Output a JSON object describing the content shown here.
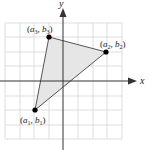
{
  "diagram": {
    "type": "coordinate-plane-triangle",
    "axes": {
      "x_label": "x",
      "y_label": "y"
    },
    "grid": {
      "x_range": [
        -4,
        4
      ],
      "y_range": [
        -4,
        4
      ],
      "step": 1
    },
    "vertices": [
      {
        "id": "p1",
        "label": "(a1, b1)",
        "grid": [
          -2,
          -2
        ]
      },
      {
        "id": "p2",
        "label": "(a2, b2)",
        "grid": [
          3,
          2
        ]
      },
      {
        "id": "p3",
        "label": "(a3, b3)",
        "grid": [
          -1,
          3
        ]
      }
    ],
    "labels": {
      "p1": {
        "open": "(",
        "a": "a",
        "a_sub": "1",
        "comma": ", ",
        "b": "b",
        "b_sub": "1",
        "close": ")"
      },
      "p2": {
        "open": "(",
        "a": "a",
        "a_sub": "2",
        "comma": ", ",
        "b": "b",
        "b_sub": "2",
        "close": ")"
      },
      "p3": {
        "open": "(",
        "a": "a",
        "a_sub": "3",
        "comma": ", ",
        "b": "b",
        "b_sub": "3",
        "close": ")"
      }
    },
    "colors": {
      "grid": "#d4d4d4",
      "axis": "#333333",
      "triangle_fill": "#e6e6e6",
      "triangle_stroke": "#555555",
      "point": "#000000"
    }
  }
}
